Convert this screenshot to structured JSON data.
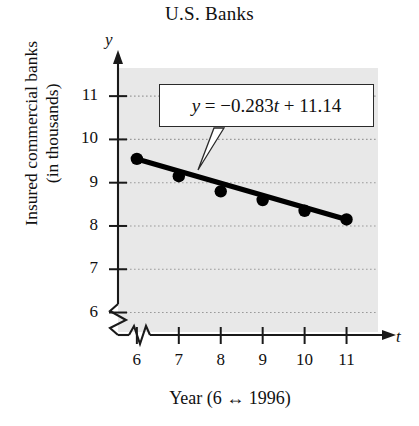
{
  "figure": {
    "title": "U.S. Banks",
    "y_axis_title_lines": [
      "Insured commercial banks",
      "(in thousands)"
    ],
    "x_axis_title": "Year (6 ↔ 1996)",
    "y_axis_letter": "y",
    "x_axis_letter": "t",
    "equation_label": "y = −0.283t + 11.14",
    "equation_parts": {
      "lhs": "y",
      "equals": "=",
      "slope": "−0.283",
      "variable": "t",
      "plus": "+",
      "intercept": "11.14"
    },
    "colors": {
      "plot_background": "#e8e8e8",
      "axis": "#1a1a1a",
      "data_line": "#000000",
      "marker": "#000000",
      "gridline": "#9a9a9a",
      "page_background": "#ffffff"
    }
  },
  "chart_data": {
    "type": "scatter",
    "title": "U.S. Banks",
    "xlabel": "Year (6 ↔ 1996)",
    "ylabel": "Insured commercial banks (in thousands)",
    "x": [
      6,
      7,
      8,
      9,
      10,
      11
    ],
    "values": [
      9.55,
      9.15,
      8.8,
      8.6,
      8.35,
      8.15
    ],
    "xtick_labels": [
      "6",
      "7",
      "8",
      "9",
      "10",
      "11"
    ],
    "ytick_labels": [
      "6",
      "7",
      "8",
      "9",
      "10",
      "11"
    ],
    "xlim": [
      5.55,
      11.75
    ],
    "ylim": [
      5.55,
      11.65
    ],
    "xticks": [
      6,
      7,
      8,
      9,
      10,
      11
    ],
    "yticks": [
      6,
      7,
      8,
      9,
      10,
      11
    ],
    "grid": true,
    "grid_axis": "y",
    "grid_style": "dotted",
    "axis_break_x": true,
    "axis_break_y": true,
    "legend": null,
    "annotations": [
      {
        "text": "y = −0.283t + 11.14",
        "points_to_x": 7,
        "points_to_y": 9.15,
        "type": "callout-box"
      }
    ],
    "fit_line": {
      "type": "linear",
      "slope": -0.283,
      "intercept": 11.14,
      "equation": "y = -0.283t + 11.14",
      "drawn_from_x": 6,
      "drawn_to_x": 11
    },
    "series": [
      {
        "name": "Insured commercial banks",
        "values": [
          9.55,
          9.15,
          8.8,
          8.6,
          8.35,
          8.15
        ]
      }
    ]
  }
}
